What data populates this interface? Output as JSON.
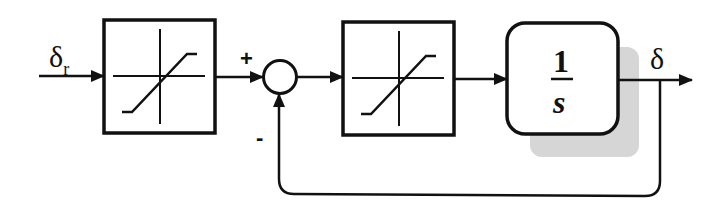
{
  "diagram": {
    "type": "block-diagram",
    "colors": {
      "stroke": "#111111",
      "shadow": "#d4d4d4",
      "background": "#ffffff"
    },
    "input": {
      "symbol": "δ",
      "subscript": "r"
    },
    "output": {
      "symbol": "δ"
    },
    "summing_junction": {
      "plus_sign": "+",
      "minus_sign": "-"
    },
    "blocks": [
      {
        "id": "saturation-1",
        "kind": "saturation"
      },
      {
        "id": "saturation-2",
        "kind": "saturation"
      },
      {
        "id": "integrator",
        "kind": "transfer-function",
        "numerator": "1",
        "denominator": "s"
      }
    ],
    "feedback": {
      "from": "output",
      "to": "summing-junction",
      "sign": "-"
    }
  }
}
